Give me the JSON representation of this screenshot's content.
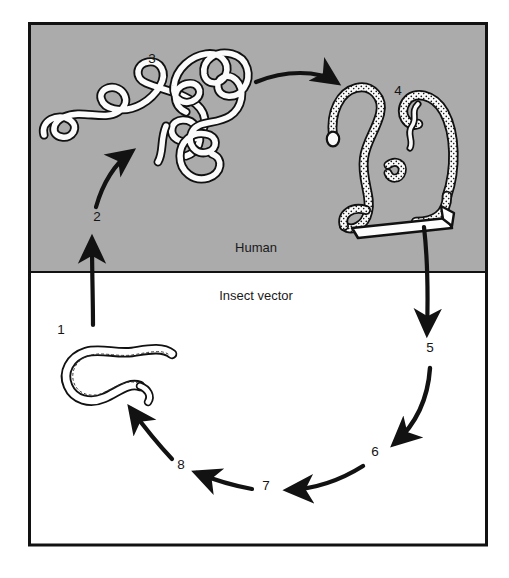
{
  "figure": {
    "frame": {
      "border_color": "#121212",
      "border_width_px": 3,
      "x": 28,
      "y": 22,
      "width": 460,
      "height": 524
    },
    "regions": [
      {
        "id": "human",
        "label": "Human",
        "background_color": "#ababab",
        "label_x": 256,
        "label_y": 252,
        "y_top": 22,
        "y_bottom": 272
      },
      {
        "id": "insect-vector",
        "label": "Insect vector",
        "background_color": "#ffffff",
        "label_x": 256,
        "label_y": 300,
        "y_top": 272,
        "y_bottom": 546
      }
    ],
    "divider": {
      "color": "#121212",
      "y": 272,
      "width_px": 2
    },
    "stage_numbers": [
      {
        "id": "stage-1",
        "text": "1",
        "x": 61,
        "y": 334,
        "region": "insect-vector"
      },
      {
        "id": "stage-2",
        "text": "2",
        "x": 97,
        "y": 221,
        "region": "human"
      },
      {
        "id": "stage-3",
        "text": "3",
        "x": 152,
        "y": 63,
        "region": "human"
      },
      {
        "id": "stage-4",
        "text": "4",
        "x": 398,
        "y": 95,
        "region": "human"
      },
      {
        "id": "stage-5",
        "text": "5",
        "x": 430,
        "y": 352,
        "region": "insect-vector"
      },
      {
        "id": "stage-6",
        "text": "6",
        "x": 375,
        "y": 456,
        "region": "insect-vector"
      },
      {
        "id": "stage-7",
        "text": "7",
        "x": 266,
        "y": 490,
        "region": "insect-vector"
      },
      {
        "id": "stage-8",
        "text": "8",
        "x": 181,
        "y": 469,
        "region": "insect-vector"
      }
    ],
    "organisms": [
      {
        "id": "adult-worms",
        "near_stage": "3",
        "description": "Pair of intertwined adult filarial worms, white bodies with dark stippled outlines",
        "fill_color": "#fbfbfb",
        "outline_color": "#111111"
      },
      {
        "id": "microfilariae-in-blood",
        "near_stage": "4",
        "description": "Speckled microfilariae and feeding insect mouthparts",
        "fill_color": "#f7f7f7",
        "outline_color": "#111111"
      },
      {
        "id": "infective-larva",
        "near_stage": "1",
        "description": "Single hook-shaped infective larva",
        "fill_color": "#ffffff",
        "outline_color": "#111111"
      }
    ],
    "arrows": [
      {
        "id": "arrow-1-to-2",
        "from": "1",
        "to": "2",
        "direction": "up",
        "crosses_divider": true
      },
      {
        "id": "arrow-2-to-3",
        "from": "2",
        "to": "3",
        "direction": "up-right",
        "crosses_divider": false
      },
      {
        "id": "arrow-3-to-4",
        "from": "3",
        "to": "4",
        "direction": "right",
        "crosses_divider": false
      },
      {
        "id": "arrow-4-to-5",
        "from": "4",
        "to": "5",
        "direction": "down",
        "crosses_divider": true
      },
      {
        "id": "arrow-5-to-6",
        "from": "5",
        "to": "6",
        "direction": "down-left",
        "crosses_divider": false
      },
      {
        "id": "arrow-6-to-7",
        "from": "6",
        "to": "7",
        "direction": "left",
        "crosses_divider": false
      },
      {
        "id": "arrow-7-to-8",
        "from": "7",
        "to": "8",
        "direction": "left",
        "crosses_divider": false
      },
      {
        "id": "arrow-8-to-1",
        "from": "8",
        "to": "1",
        "direction": "up-left",
        "crosses_divider": false
      }
    ],
    "colors": {
      "human_band": "#ababab",
      "vector_band": "#ffffff",
      "ink": "#121212",
      "page": "#ffffff"
    }
  }
}
